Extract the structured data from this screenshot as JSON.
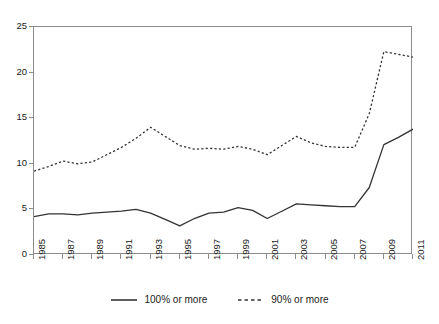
{
  "chart_data": {
    "type": "line",
    "title": "",
    "subtitle": "",
    "xlabel": "",
    "ylabel": "",
    "xlim": [
      1985,
      2011
    ],
    "ylim": [
      0,
      25
    ],
    "grid": false,
    "legend_position": "bottom-center",
    "x": [
      1985,
      1986,
      1987,
      1988,
      1989,
      1990,
      1991,
      1992,
      1993,
      1994,
      1995,
      1996,
      1997,
      1998,
      1999,
      2000,
      2001,
      2002,
      2003,
      2004,
      2005,
      2006,
      2007,
      2008,
      2009,
      2010,
      2011
    ],
    "x_tick_labels": [
      "1985",
      "1987",
      "1989",
      "1991",
      "1993",
      "1995",
      "1997",
      "1999",
      "2001",
      "2003",
      "2005",
      "2007",
      "2009",
      "2011"
    ],
    "x_tick_values": [
      1985,
      1987,
      1989,
      1991,
      1993,
      1995,
      1997,
      1999,
      2001,
      2003,
      2005,
      2007,
      2009,
      2011
    ],
    "y_tick_labels": [
      "0",
      "5",
      "10",
      "15",
      "20",
      "25"
    ],
    "y_tick_values": [
      0,
      5,
      10,
      15,
      20,
      25
    ],
    "series": [
      {
        "name": "100% or more",
        "style": "solid",
        "color": "#333333",
        "values": [
          4.2,
          4.5,
          4.5,
          4.4,
          4.6,
          4.7,
          4.8,
          5.0,
          4.6,
          3.9,
          3.2,
          4.0,
          4.6,
          4.7,
          5.2,
          4.9,
          4.0,
          4.8,
          5.6,
          5.5,
          5.4,
          5.3,
          5.3,
          7.4,
          12.1,
          12.9,
          13.8
        ]
      },
      {
        "name": "90% or more",
        "style": "dashed",
        "color": "#333333",
        "values": [
          9.2,
          9.7,
          10.3,
          10.0,
          10.2,
          11.0,
          11.8,
          12.8,
          14.0,
          13.0,
          12.0,
          11.6,
          11.7,
          11.6,
          11.9,
          11.6,
          11.0,
          12.0,
          13.0,
          12.3,
          11.9,
          11.8,
          11.8,
          15.5,
          22.3,
          22.0,
          21.7
        ]
      }
    ]
  },
  "legend": {
    "entries": [
      {
        "label": "100% or more",
        "style": "solid"
      },
      {
        "label": "90% or more",
        "style": "dashed"
      }
    ]
  },
  "colors": {
    "axis": "#8c8c8c",
    "line": "#333333",
    "text": "#1a1a1a",
    "background": "#ffffff"
  }
}
